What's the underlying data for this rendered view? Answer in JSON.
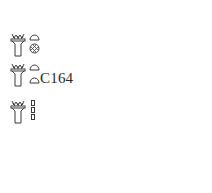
{
  "groups": [
    {
      "id": "group-1",
      "signs": [
        "vessel-with-plants",
        "loaf",
        "placenta"
      ]
    },
    {
      "id": "group-2",
      "signs": [
        "vessel-with-plants",
        "loaf",
        "loaf"
      ],
      "label": "C164"
    },
    {
      "id": "group-3",
      "signs": [
        "vessel-with-plants",
        "stroke",
        "stroke",
        "stroke"
      ]
    }
  ],
  "colors": {
    "ink": "#3a3a3a",
    "background": "#ffffff"
  }
}
